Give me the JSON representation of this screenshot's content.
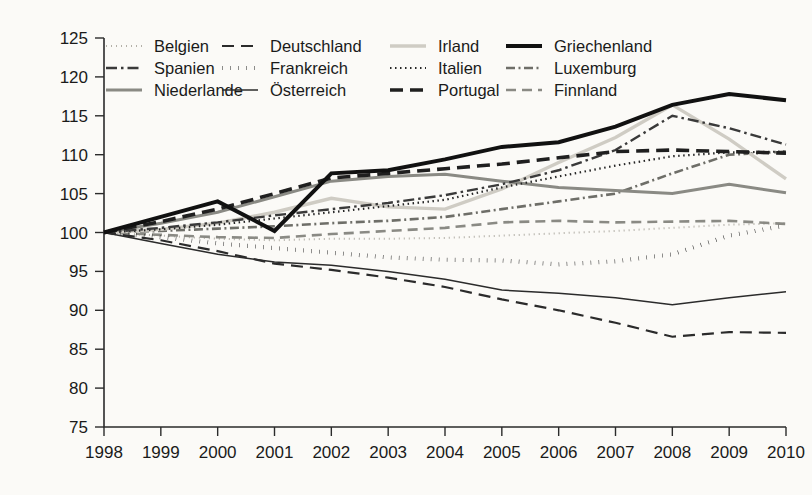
{
  "chart_data": {
    "type": "line",
    "title": "",
    "subtitle": "",
    "xlabel": "",
    "ylabel": "",
    "grid": false,
    "legend_position": "top",
    "x": [
      1998,
      1999,
      2000,
      2001,
      2002,
      2003,
      2004,
      2005,
      2006,
      2007,
      2008,
      2009,
      2010
    ],
    "xtick_labels": [
      "1998",
      "1999",
      "2000",
      "2001",
      "2002",
      "2003",
      "2004",
      "2005",
      "2006",
      "2007",
      "2008",
      "2009",
      "2010"
    ],
    "ytick_labels": [
      "75",
      "80",
      "85",
      "90",
      "95",
      "100",
      "105",
      "110",
      "115",
      "120",
      "125"
    ],
    "ylim": [
      75,
      125
    ],
    "xlim": [
      1998,
      2010
    ],
    "ytick_step": 5,
    "series": [
      {
        "name": "Belgien",
        "style": "dotted-light",
        "color": "#b3b0a8",
        "width": 2.0,
        "dash": "1,4",
        "values": [
          100,
          99.6,
          99.2,
          99.0,
          99.2,
          99.2,
          99.3,
          99.6,
          99.9,
          100.2,
          100.6,
          101.0,
          101.2
        ]
      },
      {
        "name": "Spanien",
        "style": "dash-dot",
        "color": "#3a3a3a",
        "width": 2.4,
        "dash": "11,4,2.5,4",
        "values": [
          100,
          100.6,
          101.3,
          102.2,
          103.0,
          103.8,
          104.8,
          106.2,
          108.0,
          110.6,
          115.0,
          113.4,
          111.3
        ]
      },
      {
        "name": "Niederlande",
        "style": "solid-gray",
        "color": "#8a8a84",
        "width": 3.0,
        "dash": "",
        "values": [
          100,
          101.2,
          102.6,
          104.6,
          106.6,
          107.2,
          107.5,
          106.6,
          105.8,
          105.4,
          105.0,
          106.2,
          105.1
        ]
      },
      {
        "name": "Deutschland",
        "style": "dashed",
        "color": "#2b2b2b",
        "width": 2.2,
        "dash": "12,7",
        "values": [
          100,
          99.0,
          97.6,
          96.0,
          95.2,
          94.2,
          93.0,
          91.4,
          90.0,
          88.4,
          86.6,
          87.2,
          87.1
        ]
      },
      {
        "name": "Frankreich",
        "style": "dotted-bold",
        "color": "#1f1f1f",
        "width": 4.2,
        "dash": "0.5,7.5",
        "values": [
          100,
          99.4,
          98.6,
          98.0,
          97.4,
          96.8,
          96.5,
          96.4,
          95.9,
          96.3,
          97.2,
          99.6,
          100.9
        ]
      },
      {
        "name": "Österreich",
        "style": "solid-thin",
        "color": "#2b2b2b",
        "width": 1.5,
        "dash": "",
        "values": [
          100,
          98.6,
          97.2,
          96.2,
          95.8,
          95.0,
          94.0,
          92.6,
          92.2,
          91.6,
          90.7,
          91.6,
          92.4
        ]
      },
      {
        "name": "Irland",
        "style": "solid-light",
        "color": "#cfccc4",
        "width": 3.4,
        "dash": "",
        "values": [
          100,
          100.4,
          101.2,
          102.6,
          104.4,
          103.3,
          103.0,
          105.6,
          109.0,
          112.2,
          116.4,
          112.0,
          106.9
        ]
      },
      {
        "name": "Italien",
        "style": "dotted-fine",
        "color": "#262626",
        "width": 2.2,
        "dash": "1.5,3.5",
        "values": [
          100,
          100.4,
          101.0,
          101.8,
          102.6,
          103.4,
          104.2,
          105.8,
          107.2,
          108.6,
          109.8,
          110.3,
          110.4
        ]
      },
      {
        "name": "Portugal",
        "style": "dashed-bold",
        "color": "#1f1f1f",
        "width": 3.6,
        "dash": "13,7",
        "values": [
          100,
          101.4,
          103.0,
          105.0,
          107.0,
          107.6,
          108.2,
          108.8,
          109.6,
          110.4,
          110.6,
          110.4,
          110.2
        ]
      },
      {
        "name": "Griechenland",
        "style": "solid-bold",
        "color": "#111111",
        "width": 4.0,
        "dash": "",
        "values": [
          100,
          102.0,
          104.0,
          100.2,
          107.6,
          108.0,
          109.4,
          111.0,
          111.6,
          113.6,
          116.4,
          117.8,
          117.0
        ]
      },
      {
        "name": "Luxemburg",
        "style": "dash-dot-gray",
        "color": "#6e6e68",
        "width": 2.6,
        "dash": "9,3.5,2,3.5",
        "values": [
          100,
          100.2,
          100.5,
          100.8,
          101.2,
          101.5,
          102.0,
          103.0,
          104.0,
          105.0,
          107.6,
          110.0,
          110.4
        ]
      },
      {
        "name": "Finnland",
        "style": "dashed-gray",
        "color": "#8a8a84",
        "width": 2.6,
        "dash": "10,6",
        "values": [
          100,
          99.7,
          99.4,
          99.3,
          99.8,
          100.2,
          100.6,
          101.3,
          101.5,
          101.3,
          101.4,
          101.5,
          101.1
        ]
      }
    ]
  },
  "legend": {
    "columns": [
      [
        {
          "label": "Belgien",
          "key": "Belgien"
        },
        {
          "label": "Spanien",
          "key": "Spanien"
        },
        {
          "label": "Niederlande",
          "key": "Niederlande"
        }
      ],
      [
        {
          "label": "Deutschland",
          "key": "Deutschland"
        },
        {
          "label": "Frankreich",
          "key": "Frankreich"
        },
        {
          "label": "Österreich",
          "key": "Österreich"
        }
      ],
      [
        {
          "label": "Irland",
          "key": "Irland"
        },
        {
          "label": "Italien",
          "key": "Italien"
        },
        {
          "label": "Portugal",
          "key": "Portugal"
        }
      ],
      [
        {
          "label": "Griechenland",
          "key": "Griechenland"
        },
        {
          "label": "Luxemburg",
          "key": "Luxemburg"
        },
        {
          "label": "Finnland",
          "key": "Finnland"
        }
      ]
    ]
  }
}
